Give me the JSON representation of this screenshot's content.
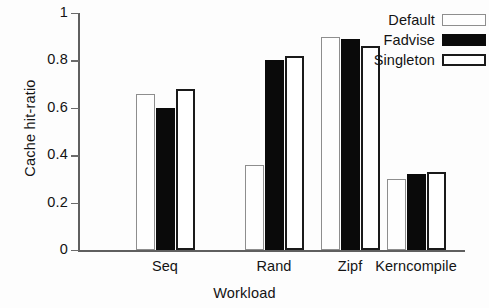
{
  "chart_data": {
    "type": "bar",
    "title": "",
    "subtitle": "",
    "xlabel": "Workload",
    "ylabel": "Cache hit-ratio",
    "categories": [
      "Seq",
      "Rand",
      "Zipf",
      "Kerncompile"
    ],
    "series": [
      {
        "name": "Default",
        "values": [
          0.66,
          0.36,
          0.9,
          0.3
        ],
        "color": "#fefefe",
        "border_color": "#8e8e8e",
        "fill": "empty"
      },
      {
        "name": "Fadvise",
        "values": [
          0.6,
          0.8,
          0.89,
          0.32
        ],
        "color": "#0a0a0a",
        "border_color": "#0a0a0a",
        "fill": "solid"
      },
      {
        "name": "Singleton",
        "values": [
          0.68,
          0.82,
          0.86,
          0.33
        ],
        "color": "#ffffff",
        "border_color": "#1a1a1a",
        "fill": "empty-bold"
      }
    ],
    "ylim": [
      0,
      1
    ],
    "yticks": [
      0,
      0.2,
      0.4,
      0.6,
      0.8,
      1
    ],
    "ytick_labels": [
      "0",
      "0.2",
      "0.4",
      "0.6",
      "0.8",
      "1"
    ],
    "grid": false,
    "legend_position": "top-right",
    "legend_entries": [
      "Default",
      "Fadvise",
      "Singleton"
    ]
  }
}
